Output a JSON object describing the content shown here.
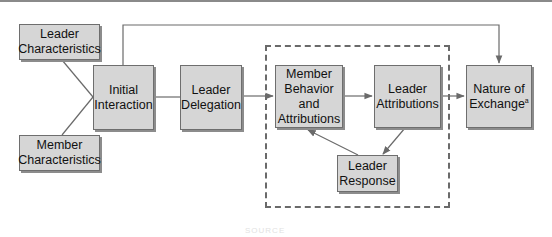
{
  "diagram": {
    "type": "flowchart",
    "nodes": {
      "leader_characteristics": {
        "label": "Leader\nCharacteristics"
      },
      "member_characteristics": {
        "label": "Member\nCharacteristics"
      },
      "initial_interaction": {
        "label": "Initial\nInteraction"
      },
      "leader_delegation": {
        "label": "Leader\nDelegation"
      },
      "member_behavior": {
        "label": "Member\nBehavior\nand\nAttributions"
      },
      "leader_attributions": {
        "label": "Leader\nAttributions"
      },
      "leader_response": {
        "label": "Leader\nResponse"
      },
      "nature_of_exchange": {
        "label": "Nature of\nExchange",
        "superscript": "a"
      }
    },
    "edges": [
      {
        "from": "leader_characteristics",
        "to": "initial_interaction",
        "arrow": false
      },
      {
        "from": "member_characteristics",
        "to": "initial_interaction",
        "arrow": false
      },
      {
        "from": "initial_interaction",
        "to": "leader_delegation",
        "arrow": false
      },
      {
        "from": "leader_delegation",
        "to": "member_behavior",
        "arrow": true
      },
      {
        "from": "member_behavior",
        "to": "leader_attributions",
        "arrow": true
      },
      {
        "from": "leader_attributions",
        "to": "leader_response",
        "arrow": true
      },
      {
        "from": "leader_response",
        "to": "member_behavior",
        "arrow": true
      },
      {
        "from": "leader_attributions",
        "to": "nature_of_exchange",
        "arrow": true
      },
      {
        "from": "initial_interaction",
        "to": "nature_of_exchange",
        "arrow": true,
        "route": "over-top"
      }
    ],
    "group": {
      "style": "dashed",
      "members": [
        "member_behavior",
        "leader_attributions",
        "leader_response"
      ]
    },
    "footer_ghost_text": "SOURCE"
  },
  "colors": {
    "node_fill": "#d6d6d6",
    "node_border": "#6e6e6e",
    "line": "#6a6a6a",
    "background": "#ffffff"
  }
}
